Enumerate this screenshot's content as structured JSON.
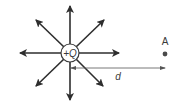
{
  "diagram": {
    "charge_label": "+Q",
    "distance_label": "d",
    "point_label": "A",
    "colors": {
      "arrow": "#2e2e2e",
      "line": "#555555",
      "text": "#3a3a3a",
      "point": "#4a4a4a"
    },
    "field_lines": [
      "up",
      "down",
      "left",
      "right",
      "up-left",
      "up-right",
      "down-left",
      "down-right"
    ]
  }
}
